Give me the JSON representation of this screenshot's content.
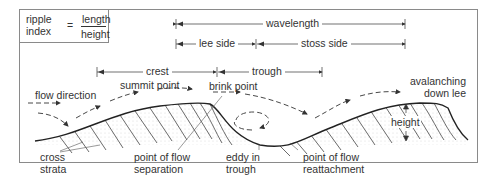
{
  "ripple_index": {
    "left_top": "ripple",
    "left_bottom": "index",
    "equals": "=",
    "numerator": "length",
    "denominator": "height"
  },
  "dimensions": {
    "wavelength": "wavelength",
    "lee_side": "lee side",
    "stoss_side": "stoss side",
    "crest": "crest",
    "trough": "trough"
  },
  "labels": {
    "flow_direction": "flow direction",
    "summit_point": "summit point",
    "brink_point": "brink point",
    "avalanching_1": "avalanching",
    "avalanching_2": "down lee",
    "height": "height",
    "cross_strata_1": "cross",
    "cross_strata_2": "strata",
    "flow_separation_1": "point of flow",
    "flow_separation_2": "separation",
    "eddy_1": "eddy in",
    "eddy_2": "trough",
    "reattachment_1": "point of flow",
    "reattachment_2": "reattachment"
  },
  "colors": {
    "line": "#333333",
    "frame": "#8a8a8a",
    "stipple": "#d8d8d8"
  }
}
